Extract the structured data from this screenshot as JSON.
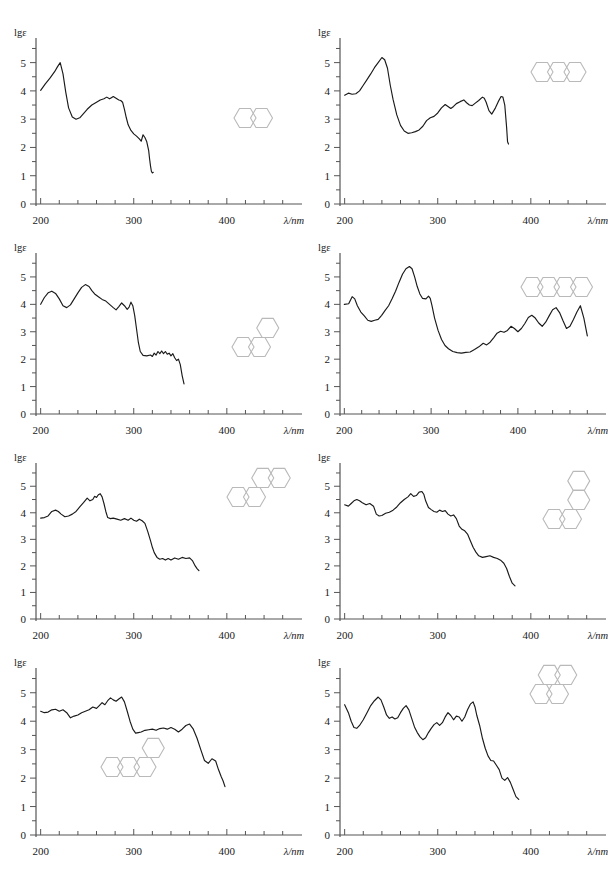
{
  "figure": {
    "type": "uv-vis-absorption-spectra-panel-set",
    "panel_count": 8,
    "axis": {
      "y_label": "lgε",
      "x_label": "λ/nm",
      "y_ticks_major": [
        0,
        1,
        2,
        3,
        4,
        5
      ],
      "y_minor_step": 0.5,
      "x_ticks_major": [
        200,
        300,
        400
      ],
      "x_minor_step": 20,
      "x_tick_labels": [
        "200",
        "300",
        "400"
      ],
      "y_tick_labels": [
        "0",
        "1",
        "2",
        "3",
        "4",
        "5"
      ],
      "curve_color": "#1a1a1a",
      "axis_color": "#555555",
      "structure_color": "#b9b9b9"
    }
  },
  "chart_data": [
    {
      "type": "line",
      "title": "",
      "xlabel": "λ/nm",
      "ylabel": "lgε",
      "xlim": [
        195,
        470
      ],
      "ylim": [
        0,
        5.8
      ],
      "structure_name": "naphthalene",
      "structure_rings": 2,
      "structure_layout": "linear",
      "x": [
        200,
        205,
        210,
        215,
        218,
        221,
        224,
        227,
        230,
        234,
        238,
        242,
        246,
        250,
        255,
        260,
        264,
        268,
        271,
        274,
        276,
        278,
        281,
        284,
        286,
        288,
        290,
        292,
        294,
        297,
        300,
        303,
        306,
        308,
        310,
        312,
        314,
        316,
        317,
        318,
        319,
        320,
        321
      ],
      "y": [
        4.02,
        4.25,
        4.45,
        4.68,
        4.85,
        5.0,
        4.6,
        3.95,
        3.4,
        3.08,
        3.0,
        3.05,
        3.2,
        3.35,
        3.5,
        3.6,
        3.68,
        3.72,
        3.78,
        3.72,
        3.76,
        3.8,
        3.74,
        3.68,
        3.66,
        3.6,
        3.35,
        3.05,
        2.8,
        2.6,
        2.48,
        2.4,
        2.3,
        2.22,
        2.45,
        2.35,
        2.2,
        1.9,
        1.6,
        1.35,
        1.15,
        1.1,
        1.12
      ]
    },
    {
      "type": "line",
      "title": "",
      "xlabel": "λ/nm",
      "ylabel": "lgε",
      "xlim": [
        195,
        470
      ],
      "ylim": [
        0,
        5.8
      ],
      "structure_name": "anthracene",
      "structure_rings": 3,
      "structure_layout": "linear",
      "x": [
        200,
        204,
        208,
        212,
        216,
        220,
        224,
        228,
        232,
        236,
        240,
        243,
        246,
        249,
        252,
        256,
        260,
        264,
        268,
        272,
        276,
        280,
        284,
        288,
        292,
        296,
        300,
        304,
        308,
        311,
        314,
        317,
        320,
        324,
        328,
        331,
        334,
        337,
        340,
        344,
        348,
        350,
        352,
        355,
        358,
        362,
        365,
        368,
        370,
        372,
        374,
        375,
        376
      ],
      "y": [
        3.85,
        3.92,
        3.88,
        3.9,
        4.0,
        4.2,
        4.4,
        4.6,
        4.82,
        5.0,
        5.18,
        5.1,
        4.8,
        4.2,
        3.7,
        3.15,
        2.78,
        2.58,
        2.5,
        2.52,
        2.56,
        2.62,
        2.75,
        2.95,
        3.05,
        3.1,
        3.22,
        3.4,
        3.52,
        3.45,
        3.38,
        3.45,
        3.55,
        3.62,
        3.68,
        3.58,
        3.5,
        3.48,
        3.56,
        3.66,
        3.78,
        3.74,
        3.6,
        3.3,
        3.18,
        3.4,
        3.62,
        3.8,
        3.78,
        3.5,
        2.7,
        2.2,
        2.12
      ]
    },
    {
      "type": "line",
      "title": "",
      "xlabel": "λ/nm",
      "ylabel": "lgε",
      "xlim": [
        195,
        470
      ],
      "ylim": [
        0,
        5.8
      ],
      "structure_name": "phenanthrene",
      "structure_rings": 3,
      "structure_layout": "angular",
      "x": [
        200,
        204,
        208,
        212,
        216,
        220,
        224,
        228,
        232,
        236,
        240,
        244,
        248,
        252,
        255,
        258,
        262,
        266,
        270,
        274,
        278,
        281,
        284,
        287,
        290,
        293,
        295,
        297,
        299,
        301,
        303,
        305,
        307,
        310,
        314,
        318,
        320,
        322,
        324,
        326,
        328,
        330,
        332,
        334,
        336,
        338,
        340,
        342,
        344,
        346,
        348,
        350,
        352,
        354
      ],
      "y": [
        4.0,
        4.25,
        4.42,
        4.48,
        4.4,
        4.2,
        3.95,
        3.88,
        3.98,
        4.2,
        4.42,
        4.62,
        4.72,
        4.65,
        4.5,
        4.38,
        4.28,
        4.18,
        4.12,
        4.0,
        3.88,
        3.8,
        3.92,
        4.05,
        3.95,
        3.82,
        3.9,
        4.08,
        3.95,
        3.6,
        3.1,
        2.6,
        2.28,
        2.14,
        2.12,
        2.15,
        2.1,
        2.22,
        2.15,
        2.28,
        2.2,
        2.3,
        2.2,
        2.28,
        2.18,
        2.22,
        2.12,
        2.2,
        2.05,
        1.95,
        2.0,
        1.8,
        1.4,
        1.1
      ]
    },
    {
      "type": "line",
      "title": "",
      "xlabel": "λ/nm",
      "ylabel": "lgε",
      "xlim": [
        195,
        490
      ],
      "ylim": [
        0,
        5.8
      ],
      "structure_name": "tetracene",
      "structure_rings": 4,
      "structure_layout": "linear",
      "x": [
        200,
        205,
        209,
        212,
        215,
        219,
        223,
        227,
        231,
        235,
        239,
        243,
        247,
        251,
        255,
        259,
        263,
        267,
        271,
        275,
        278,
        281,
        284,
        287,
        290,
        294,
        297,
        299,
        301,
        304,
        308,
        312,
        316,
        320,
        325,
        330,
        335,
        340,
        345,
        350,
        355,
        360,
        364,
        368,
        372,
        376,
        380,
        384,
        388,
        392,
        396,
        400,
        404,
        408,
        412,
        416,
        420,
        424,
        428,
        432,
        436,
        440,
        444,
        448,
        452,
        456,
        460,
        464,
        468,
        472,
        476,
        480
      ],
      "y": [
        4.0,
        4.02,
        4.28,
        4.2,
        3.95,
        3.72,
        3.58,
        3.42,
        3.38,
        3.42,
        3.45,
        3.6,
        3.78,
        3.95,
        4.2,
        4.48,
        4.8,
        5.1,
        5.3,
        5.38,
        5.3,
        5.0,
        4.65,
        4.38,
        4.22,
        4.2,
        4.3,
        4.22,
        3.95,
        3.5,
        3.05,
        2.72,
        2.5,
        2.38,
        2.28,
        2.24,
        2.22,
        2.25,
        2.26,
        2.35,
        2.45,
        2.58,
        2.52,
        2.62,
        2.78,
        2.95,
        3.02,
        2.98,
        3.05,
        3.2,
        3.12,
        3.0,
        3.12,
        3.3,
        3.52,
        3.6,
        3.5,
        3.32,
        3.2,
        3.35,
        3.58,
        3.8,
        3.88,
        3.7,
        3.4,
        3.12,
        3.2,
        3.45,
        3.72,
        3.95,
        3.5,
        2.85
      ]
    },
    {
      "type": "line",
      "title": "",
      "xlabel": "λ/nm",
      "ylabel": "lgε",
      "xlim": [
        195,
        470
      ],
      "ylim": [
        0,
        5.8
      ],
      "structure_name": "chrysene",
      "structure_rings": 4,
      "structure_layout": "angular",
      "x": [
        200,
        204,
        208,
        212,
        216,
        219,
        222,
        226,
        230,
        234,
        238,
        242,
        246,
        250,
        253,
        256,
        258,
        260,
        262,
        264,
        266,
        268,
        270,
        272,
        275,
        278,
        282,
        286,
        290,
        294,
        297,
        300,
        303,
        306,
        309,
        312,
        315,
        318,
        320,
        322,
        325,
        328,
        331,
        334,
        337,
        340,
        344,
        348,
        352,
        356,
        360,
        363,
        366,
        368,
        370
      ],
      "y": [
        3.8,
        3.82,
        3.88,
        4.05,
        4.1,
        4.05,
        3.95,
        3.85,
        3.88,
        3.95,
        4.05,
        4.22,
        4.38,
        4.55,
        4.45,
        4.5,
        4.62,
        4.58,
        4.68,
        4.72,
        4.6,
        4.35,
        4.05,
        3.82,
        3.78,
        3.8,
        3.76,
        3.72,
        3.78,
        3.72,
        3.8,
        3.72,
        3.68,
        3.76,
        3.7,
        3.6,
        3.3,
        2.95,
        2.7,
        2.5,
        2.32,
        2.25,
        2.28,
        2.22,
        2.28,
        2.22,
        2.3,
        2.25,
        2.32,
        2.28,
        2.3,
        2.2,
        2.0,
        1.9,
        1.82
      ]
    },
    {
      "type": "line",
      "title": "",
      "xlabel": "λ/nm",
      "ylabel": "lgε",
      "xlim": [
        195,
        470
      ],
      "ylim": [
        0,
        5.8
      ],
      "structure_name": "benzo[c]phenanthrene",
      "structure_rings": 4,
      "structure_layout": "helical",
      "x": [
        200,
        204,
        207,
        210,
        213,
        216,
        219,
        223,
        227,
        231,
        234,
        237,
        240,
        244,
        248,
        252,
        256,
        260,
        264,
        268,
        271,
        274,
        277,
        280,
        283,
        285,
        287,
        290,
        293,
        296,
        299,
        302,
        305,
        308,
        311,
        314,
        317,
        320,
        323,
        326,
        329,
        332,
        335,
        338,
        341,
        344,
        348,
        352,
        356,
        360,
        364,
        368,
        371,
        374,
        377,
        380,
        383
      ],
      "y": [
        4.3,
        4.25,
        4.35,
        4.45,
        4.5,
        4.45,
        4.38,
        4.3,
        4.35,
        4.25,
        3.95,
        3.88,
        3.9,
        3.98,
        4.02,
        4.1,
        4.22,
        4.38,
        4.5,
        4.6,
        4.72,
        4.62,
        4.65,
        4.78,
        4.8,
        4.7,
        4.45,
        4.2,
        4.12,
        4.05,
        4.02,
        4.1,
        4.05,
        4.08,
        3.95,
        3.88,
        3.92,
        3.78,
        3.5,
        3.38,
        3.32,
        3.2,
        2.95,
        2.7,
        2.52,
        2.38,
        2.32,
        2.35,
        2.38,
        2.32,
        2.28,
        2.2,
        2.1,
        1.9,
        1.6,
        1.35,
        1.25
      ]
    },
    {
      "type": "line",
      "title": "",
      "xlabel": "λ/nm",
      "ylabel": "lgε",
      "xlim": [
        195,
        470
      ],
      "ylim": [
        0,
        5.8
      ],
      "structure_name": "benz[a]anthracene",
      "structure_rings": 4,
      "structure_layout": "angular",
      "x": [
        200,
        204,
        208,
        212,
        216,
        220,
        224,
        228,
        232,
        236,
        240,
        244,
        248,
        252,
        256,
        260,
        263,
        266,
        269,
        272,
        275,
        278,
        281,
        284,
        287,
        290,
        293,
        296,
        299,
        302,
        305,
        308,
        312,
        316,
        320,
        324,
        328,
        332,
        336,
        340,
        344,
        348,
        352,
        356,
        360,
        364,
        368,
        372,
        376,
        380,
        384,
        388,
        391,
        394,
        396,
        398
      ],
      "y": [
        4.35,
        4.3,
        4.32,
        4.4,
        4.42,
        4.35,
        4.4,
        4.3,
        4.12,
        4.18,
        4.22,
        4.3,
        4.35,
        4.4,
        4.5,
        4.45,
        4.55,
        4.65,
        4.58,
        4.72,
        4.82,
        4.75,
        4.7,
        4.78,
        4.85,
        4.68,
        4.35,
        4.0,
        3.72,
        3.58,
        3.6,
        3.62,
        3.68,
        3.7,
        3.72,
        3.68,
        3.74,
        3.76,
        3.72,
        3.78,
        3.72,
        3.62,
        3.72,
        3.85,
        3.9,
        3.72,
        3.4,
        3.0,
        2.62,
        2.52,
        2.68,
        2.6,
        2.3,
        2.05,
        1.9,
        1.7
      ]
    },
    {
      "type": "line",
      "title": "",
      "xlabel": "λ/nm",
      "ylabel": "lgε",
      "xlim": [
        195,
        470
      ],
      "ylim": [
        0,
        5.8
      ],
      "structure_name": "pyrene",
      "structure_rings": 4,
      "structure_layout": "peri-fused",
      "x": [
        200,
        204,
        207,
        210,
        213,
        216,
        220,
        224,
        228,
        232,
        236,
        239,
        242,
        245,
        248,
        251,
        254,
        257,
        260,
        263,
        266,
        269,
        272,
        275,
        278,
        281,
        284,
        287,
        290,
        293,
        296,
        299,
        302,
        305,
        308,
        311,
        314,
        317,
        320,
        323,
        326,
        329,
        332,
        335,
        338,
        340,
        342,
        345,
        348,
        351,
        354,
        357,
        360,
        363,
        366,
        369,
        372,
        375,
        378,
        381,
        384,
        387
      ],
      "y": [
        4.58,
        4.3,
        4.0,
        3.78,
        3.75,
        3.85,
        4.05,
        4.3,
        4.55,
        4.72,
        4.85,
        4.75,
        4.5,
        4.22,
        4.1,
        4.15,
        4.08,
        4.12,
        4.3,
        4.45,
        4.55,
        4.4,
        4.1,
        3.8,
        3.6,
        3.45,
        3.35,
        3.42,
        3.6,
        3.75,
        3.88,
        3.95,
        3.85,
        3.95,
        4.15,
        4.3,
        4.2,
        4.05,
        4.18,
        4.15,
        4.0,
        4.15,
        4.4,
        4.6,
        4.68,
        4.5,
        4.2,
        3.85,
        3.4,
        3.05,
        2.78,
        2.62,
        2.6,
        2.45,
        2.3,
        2.0,
        1.92,
        2.02,
        1.85,
        1.6,
        1.35,
        1.25
      ]
    }
  ]
}
